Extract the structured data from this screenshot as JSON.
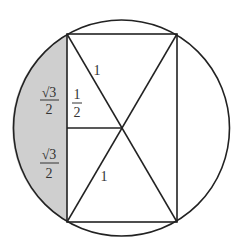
{
  "diagram": {
    "colors": {
      "background": "#ffffff",
      "stroke": "#222222",
      "shade": "#cfcfcf",
      "text": "#333333"
    },
    "circle": {
      "cx": 121.5,
      "cy": 128,
      "r": 108
    },
    "rectangle": {
      "x1": 67,
      "y1": 34,
      "x2": 177,
      "y2": 222
    },
    "labels": {
      "upper_left_num": "√3",
      "upper_left_den": "2",
      "half_num": "1",
      "half_den": "2",
      "lower_left_num": "√3",
      "lower_left_den": "2",
      "diag_upper": "1",
      "diag_lower": "1"
    }
  }
}
